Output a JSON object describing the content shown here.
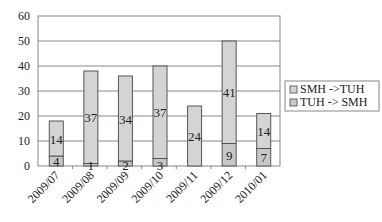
{
  "chart_data": {
    "type": "bar",
    "stacked": true,
    "title": "",
    "xlabel": "",
    "ylabel": "",
    "categories": [
      "2009/07",
      "2009/08",
      "2009/09",
      "2009/10",
      "2009/11",
      "2009/12",
      "2010/01"
    ],
    "series": [
      {
        "name": "SMH ->TUH",
        "values": [
          14,
          37,
          34,
          37,
          24,
          41,
          14
        ],
        "color": "#d4d4d4"
      },
      {
        "name": "TUH -> SMH",
        "values": [
          4,
          1,
          2,
          3,
          0,
          9,
          7
        ],
        "color": "#c8c8c8"
      }
    ],
    "stack_order": [
      "TUH -> SMH",
      "SMH ->TUH"
    ],
    "data_labels": {
      "SMH ->TUH": [
        "14",
        "37",
        "34",
        "37",
        "24",
        "41",
        "14"
      ],
      "TUH -> SMH": [
        "4",
        "1",
        "2",
        "3",
        "",
        "9",
        "7"
      ]
    },
    "ylim": [
      0,
      60
    ],
    "yticks": [
      0,
      10,
      20,
      30,
      40,
      50,
      60
    ],
    "ytick_labels": [
      "0",
      "10",
      "20",
      "30",
      "40",
      "50",
      "60"
    ],
    "grid": true,
    "legend_position": "right"
  }
}
